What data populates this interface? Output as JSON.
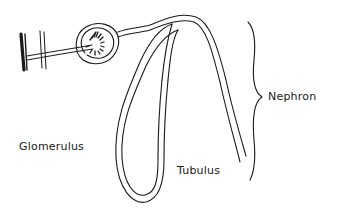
{
  "diagram": {
    "type": "hand-drawn anatomical sketch",
    "subject": "Nephron",
    "labels": {
      "nephron": "Nephron",
      "glomerulus": "Glomerulus",
      "tubulus": "Tubulus"
    },
    "parts": [
      {
        "id": "blood-vessel",
        "description": "thick vertical line at left with parallel thin walls"
      },
      {
        "id": "afferent-vessel",
        "description": "thin tube from vessel into capsule"
      },
      {
        "id": "glomerulus",
        "description": "tuft of capillaries inside capsule"
      },
      {
        "id": "bowman-capsule",
        "description": "double-walled circle"
      },
      {
        "id": "tubule",
        "description": "long double-walled looped tube"
      },
      {
        "id": "brace",
        "description": "curly brace grouping the nephron"
      }
    ],
    "colors": {
      "ink": "#1a1a1a",
      "background": "#ffffff"
    }
  }
}
